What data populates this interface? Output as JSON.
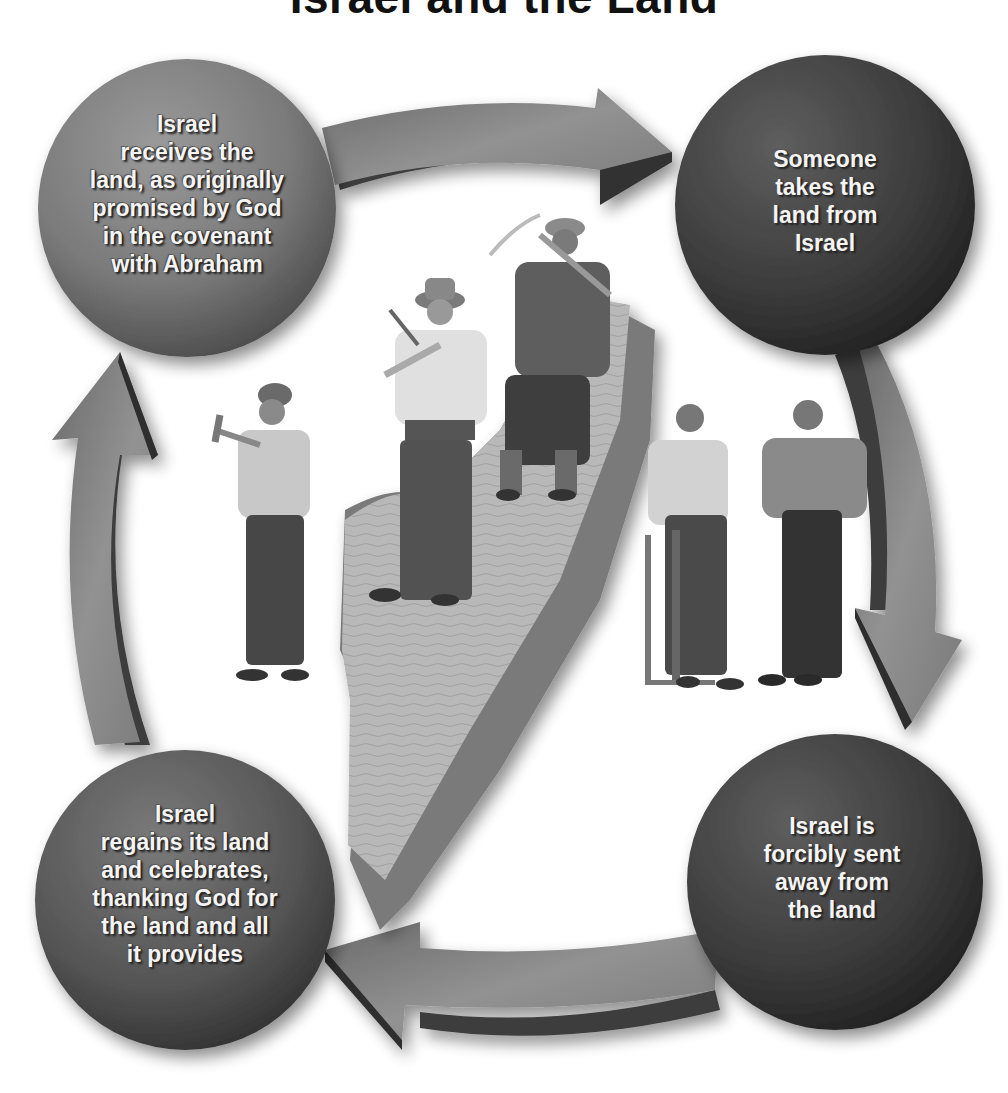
{
  "title": "Israel and the Land",
  "colors": {
    "background": "#ffffff",
    "circle_light": "#8c8c8c",
    "circle_dark": "#3a3a3a",
    "arrow_face": "#8a8a8a",
    "arrow_side": "#3c3c3c",
    "land_top": "#b4b4b4",
    "land_side": "#7a7a7a",
    "text": "#f4f4f4"
  },
  "cycle": [
    {
      "id": "receive",
      "position": "top-left",
      "lines": [
        "Israel",
        "receives the",
        "land, as originally",
        "promised by God",
        "in the covenant",
        "with Abraham"
      ]
    },
    {
      "id": "taken",
      "position": "top-right",
      "lines": [
        "Someone",
        "takes the",
        "land from",
        "Israel"
      ]
    },
    {
      "id": "exiled",
      "position": "bottom-right",
      "lines": [
        "Israel is",
        "forcibly sent",
        "away from",
        "the land"
      ]
    },
    {
      "id": "regain",
      "position": "bottom-left",
      "lines": [
        "Israel",
        "regains its land",
        "and celebrates,",
        "thanking God for",
        "the land and all",
        "it provides"
      ]
    }
  ],
  "arrows": [
    {
      "from": "receive",
      "to": "taken",
      "direction": "right"
    },
    {
      "from": "taken",
      "to": "exiled",
      "direction": "down"
    },
    {
      "from": "exiled",
      "to": "regain",
      "direction": "left"
    },
    {
      "from": "regain",
      "to": "receive",
      "direction": "up"
    }
  ],
  "illustration": {
    "land_shape": "map-of-israel",
    "figures": [
      "worker-with-pickaxe-left",
      "worker-with-pickaxe-hat",
      "worker-with-pickaxe-top",
      "worker-with-saw",
      "worker-hands-on-hips"
    ]
  }
}
